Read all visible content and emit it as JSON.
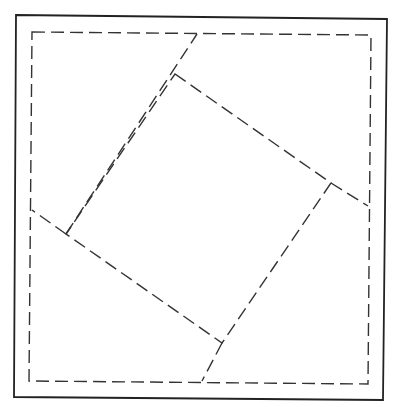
{
  "diagram": {
    "type": "geometric-construction",
    "stroke_color": "#333333",
    "outer_square": {
      "style": "solid",
      "points": [
        [
          16,
          15
        ],
        [
          387,
          19
        ],
        [
          383,
          400
        ],
        [
          14,
          397
        ]
      ]
    },
    "inner_square": {
      "style": "dashed",
      "points": [
        [
          32,
          32
        ],
        [
          371,
          35
        ],
        [
          368,
          384
        ],
        [
          29,
          381
        ]
      ]
    },
    "tilted_square": {
      "style": "dashed",
      "points": [
        [
          175,
          74
        ],
        [
          331,
          183
        ],
        [
          222,
          343
        ],
        [
          66,
          234
        ]
      ]
    },
    "extension_lines": [
      {
        "from": [
          66,
          234
        ],
        "to": [
          197,
          34
        ]
      },
      {
        "from": [
          331,
          183
        ],
        "to": [
          368,
          206
        ]
      },
      {
        "from": [
          222,
          343
        ],
        "to": [
          202,
          381
        ]
      },
      {
        "from": [
          66,
          234
        ],
        "to": [
          32,
          210
        ]
      }
    ]
  }
}
